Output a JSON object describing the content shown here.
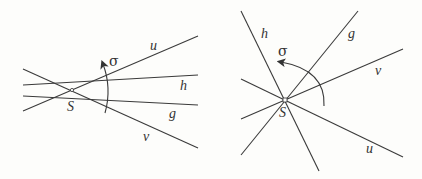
{
  "diagrams": [
    {
      "id": "left",
      "center_label": "S",
      "rotation_label": "σ",
      "lines": [
        {
          "label": "u",
          "x1": 23,
          "y1": 111,
          "x2": 198,
          "y2": 36,
          "lx": 150,
          "ly": 51
        },
        {
          "label": "h",
          "x1": 23,
          "y1": 85,
          "x2": 198,
          "y2": 75,
          "lx": 180,
          "ly": 90
        },
        {
          "label": "g",
          "x1": 23,
          "y1": 96,
          "x2": 198,
          "y2": 105,
          "lx": 169,
          "ly": 118
        },
        {
          "label": "v",
          "x1": 23,
          "y1": 69,
          "x2": 198,
          "y2": 148,
          "lx": 143,
          "ly": 141
        }
      ],
      "center": {
        "x": 72,
        "y": 90,
        "lx": 68,
        "ly": 112
      },
      "arc": {
        "path": "M 105 113 Q 115 88 103 63",
        "lx": 109,
        "ly": 64
      }
    },
    {
      "id": "right",
      "center_label": "S",
      "rotation_label": "σ",
      "lines": [
        {
          "label": "h",
          "x1": 241,
          "y1": 11,
          "x2": 319,
          "y2": 171,
          "lx": 260,
          "ly": 37
        },
        {
          "label": "g",
          "x1": 358,
          "y1": 11,
          "x2": 241,
          "y2": 155,
          "lx": 348,
          "ly": 38
        },
        {
          "label": "v",
          "x1": 403,
          "y1": 49,
          "x2": 241,
          "y2": 119,
          "lx": 376,
          "ly": 75
        },
        {
          "label": "u",
          "x1": 241,
          "y1": 79,
          "x2": 403,
          "y2": 157,
          "lx": 366,
          "ly": 154
        }
      ],
      "center": {
        "x": 285,
        "y": 100,
        "lx": 279,
        "ly": 118
      },
      "arc": {
        "path": "M 325 106 Q 325 70 280 63",
        "lx": 278,
        "ly": 56
      }
    }
  ],
  "labels": {
    "left_u": "u",
    "left_h": "h",
    "left_g": "g",
    "left_v": "v",
    "left_S": "S",
    "left_sigma": "σ",
    "right_h": "h",
    "right_g": "g",
    "right_v": "v",
    "right_u": "u",
    "right_S": "S",
    "right_sigma": "σ"
  }
}
